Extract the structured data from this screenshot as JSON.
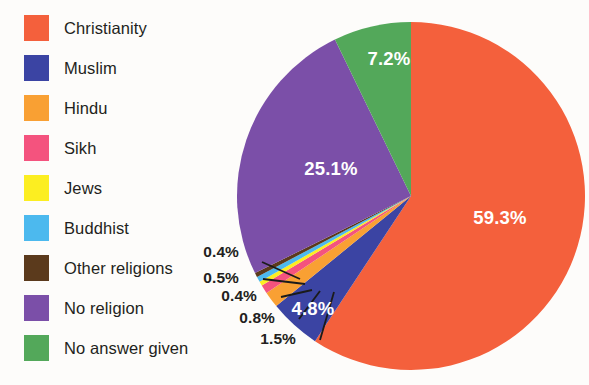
{
  "background_color": "#fdfcfa",
  "legend": {
    "items": [
      {
        "label": "Christianity",
        "color": "#f4603c",
        "icon": "color-swatch"
      },
      {
        "label": "Muslim",
        "color": "#3b44a3",
        "icon": "color-swatch"
      },
      {
        "label": "Hindu",
        "color": "#f9a033",
        "icon": "color-swatch"
      },
      {
        "label": "Sikh",
        "color": "#f4537e",
        "icon": "color-swatch"
      },
      {
        "label": "Jews",
        "color": "#fcee21",
        "icon": "color-swatch"
      },
      {
        "label": "Buddhist",
        "color": "#4cb9ee",
        "icon": "color-swatch"
      },
      {
        "label": "Other religions",
        "color": "#5b3a1c",
        "icon": "color-swatch"
      },
      {
        "label": "No religion",
        "color": "#7b4fa8",
        "icon": "color-swatch"
      },
      {
        "label": "No answer given",
        "color": "#53a85a",
        "icon": "color-swatch"
      }
    ]
  },
  "chart_data": {
    "type": "pie",
    "title": "",
    "xlabel": "",
    "ylabel": "",
    "legend_position": "left",
    "grid": false,
    "categories": [
      "Christianity",
      "Muslim",
      "Hindu",
      "Sikh",
      "Jews",
      "Buddhist",
      "Other religions",
      "No religion",
      "No answer given"
    ],
    "values": [
      59.3,
      4.8,
      1.5,
      0.8,
      0.4,
      0.5,
      0.4,
      25.1,
      7.2
    ],
    "colors": [
      "#f4603c",
      "#3b44a3",
      "#f9a033",
      "#f4537e",
      "#fcee21",
      "#4cb9ee",
      "#5b3a1c",
      "#7b4fa8",
      "#53a85a"
    ],
    "value_labels": [
      "59.3%",
      "4.8%",
      "1.5%",
      "0.8%",
      "0.4%",
      "0.5%",
      "0.4%",
      "25.1%",
      "7.2%"
    ],
    "inside_labels": [
      "59.3%",
      "4.8%",
      "25.1%",
      "7.2%"
    ],
    "callout_labels": [
      "0.4%",
      "0.5%",
      "0.4%",
      "0.8%",
      "1.5%"
    ],
    "units": "percent",
    "total": 99.6,
    "start_angle_deg": -90,
    "direction": "clockwise",
    "label_color_inside": "#ffffff",
    "label_color_outside": "#231f20"
  },
  "pie_geometry": {
    "center_x": 411,
    "center_y": 196,
    "radius": 174
  },
  "slice_label_positions": {
    "christianity": {
      "text": "59.3%",
      "x": 500,
      "y": 224
    },
    "muslim": {
      "text": "4.8%",
      "x": 313,
      "y": 315
    },
    "no_religion": {
      "text": "25.1%",
      "x": 331,
      "y": 175
    },
    "no_answer": {
      "text": "7.2%",
      "x": 389,
      "y": 65
    }
  },
  "callouts": [
    {
      "text": "0.4%",
      "x": 239,
      "y": 257,
      "series": "Other religions"
    },
    {
      "text": "0.5%",
      "x": 239,
      "y": 283,
      "series": "Buddhist"
    },
    {
      "text": "0.4%",
      "x": 257,
      "y": 301,
      "series": "Jews"
    },
    {
      "text": "0.8%",
      "x": 275,
      "y": 323,
      "series": "Sikh"
    },
    {
      "text": "1.5%",
      "x": 296,
      "y": 344,
      "series": "Hindu"
    }
  ]
}
